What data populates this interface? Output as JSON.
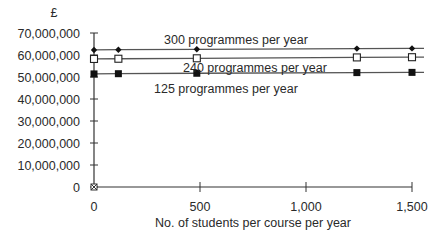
{
  "chart_data": {
    "type": "line",
    "title": "",
    "ylabel": "£",
    "xlabel": "No. of students per course per year",
    "xlim": [
      0,
      1500
    ],
    "ylim": [
      0,
      70000000
    ],
    "x_ticks": [
      0,
      500,
      1000,
      1500
    ],
    "x_tick_labels": [
      "0",
      "500",
      "1,000",
      "1,500"
    ],
    "y_ticks": [
      0,
      10000000,
      20000000,
      30000000,
      40000000,
      50000000,
      60000000,
      70000000
    ],
    "y_tick_labels": [
      "0",
      "10,000,000",
      "20,000,000",
      "30,000,000",
      "40,000,000",
      "50,000,000",
      "60,000,000",
      "70,000,000"
    ],
    "grid": false,
    "legend": "inline labels",
    "x": [
      0,
      115,
      485,
      1240,
      1500
    ],
    "series": [
      {
        "name": "300 programmes per year",
        "marker": "filled-diamond",
        "values": [
          62300000,
          62400000,
          62600000,
          62900000,
          63000000
        ]
      },
      {
        "name": "240 programmes per year",
        "marker": "open-square",
        "values": [
          58200000,
          58300000,
          58500000,
          58900000,
          59000000
        ]
      },
      {
        "name": "125 programmes per year",
        "marker": "filled-square",
        "values": [
          51400000,
          51500000,
          51700000,
          52000000,
          52100000
        ]
      }
    ],
    "annotations": [
      "origin marker at (0, 0)"
    ]
  }
}
